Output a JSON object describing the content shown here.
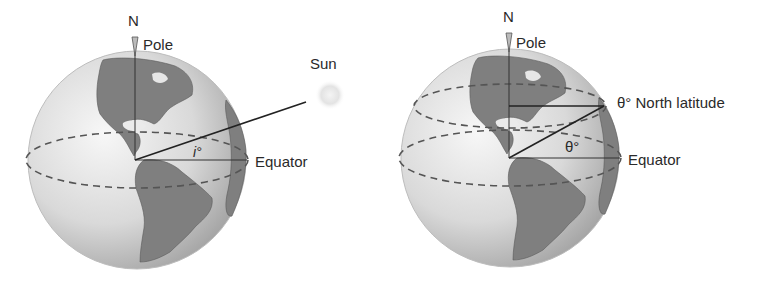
{
  "figure_left": {
    "north_label": "N",
    "pole_label": "Pole",
    "sun_label": "Sun",
    "angle_label": "i°",
    "equator_label": "Equator"
  },
  "figure_right": {
    "north_label": "N",
    "pole_label": "Pole",
    "latitude_label": "θ° North latitude",
    "angle_label": "θ°",
    "equator_label": "Equator"
  },
  "colors": {
    "background": "#ffffff",
    "ocean_light": "#f2f2f2",
    "ocean_dark": "#a8a8a8",
    "land": "#7d7d7d",
    "line": "#222222",
    "dash": "#555555",
    "text": "#2a2a2a"
  }
}
